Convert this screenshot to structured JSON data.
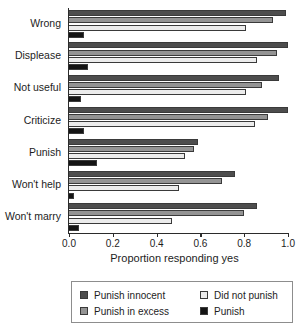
{
  "chart_data": {
    "type": "bar",
    "orientation": "horizontal",
    "title": "",
    "xlabel": "Proportion responding yes",
    "ylabel": "",
    "xlim": [
      0.0,
      1.0
    ],
    "xticks": [
      0.0,
      0.2,
      0.4,
      0.6,
      0.8,
      1.0
    ],
    "xticklabels": [
      "0.0",
      "0.2",
      "0.4",
      "0.6",
      "0.8",
      "1.0"
    ],
    "grid": false,
    "legend_position": "below-plot",
    "categories": [
      "Wrong",
      "Displease",
      "Not useful",
      "Criticize",
      "Punish",
      "Won't help",
      "Won't marry"
    ],
    "series": [
      {
        "name": "Punish innocent",
        "color": "#4d4d4d",
        "values": [
          0.99,
          1.0,
          0.96,
          1.0,
          0.59,
          0.76,
          0.86
        ]
      },
      {
        "name": "Punish in excess",
        "color": "#949494",
        "values": [
          0.93,
          0.95,
          0.88,
          0.91,
          0.57,
          0.7,
          0.8
        ]
      },
      {
        "name": "Did not punish",
        "color": "#ececec",
        "values": [
          0.81,
          0.86,
          0.81,
          0.85,
          0.53,
          0.5,
          0.47
        ]
      },
      {
        "name": "Punish",
        "color": "#141414",
        "values": [
          0.07,
          0.085,
          0.055,
          0.07,
          0.13,
          0.025,
          0.045
        ]
      }
    ]
  },
  "legend": {
    "entries": [
      {
        "label": "Punish innocent",
        "color": "#4d4d4d"
      },
      {
        "label": "Did not punish",
        "color": "#ececec"
      },
      {
        "label": "Punish in excess",
        "color": "#949494"
      },
      {
        "label": "Punish",
        "color": "#141414"
      }
    ]
  }
}
